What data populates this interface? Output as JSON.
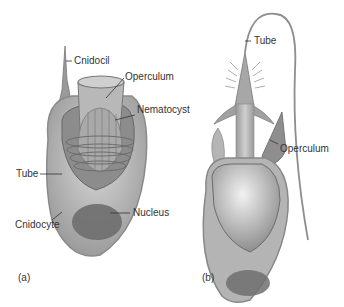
{
  "diagram": {
    "panels": [
      {
        "id": "a",
        "caption": "(a)",
        "labels": {
          "cnidocil": "Cnidocil",
          "operculum": "Operculum",
          "nematocyst": "Nematocyst",
          "tube": "Tube",
          "cnidocyte": "Cnidocyte",
          "nucleus": "Nucleus"
        }
      },
      {
        "id": "b",
        "caption": "(b)",
        "labels": {
          "tube": "Tube",
          "operculum": "Operculum"
        }
      }
    ],
    "colors": {
      "cell_fill": "#bfbfbf",
      "cell_outline": "#8a8a8a",
      "inner_dark": "#7a7a7a",
      "nucleus": "#6e6e6e",
      "line": "#333333"
    }
  }
}
